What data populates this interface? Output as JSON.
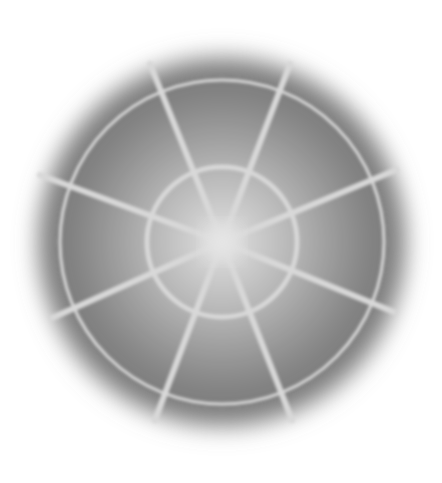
{
  "image": {
    "description": "Blurred grayscale radial web pattern",
    "center": [
      222,
      242
    ],
    "blob_radius": 192,
    "outer_ring_radius": 162,
    "inner_ring_radius": 75,
    "spoke_count": 8,
    "colors": {
      "background": "#ffffff",
      "center_glow": "#e0e0e0",
      "mid_gray": "#a0a0a0",
      "edge_gray": "#707070",
      "line": "#d6d6d6"
    }
  }
}
